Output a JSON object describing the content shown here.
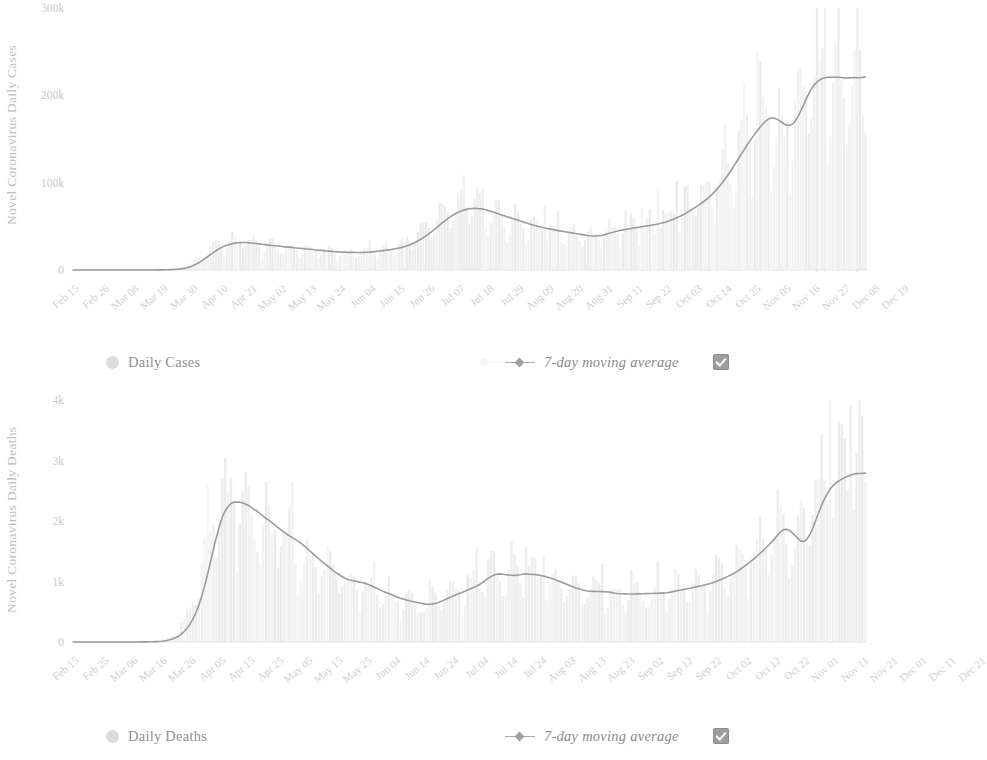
{
  "charts": [
    {
      "id": "cases",
      "ylabel": "Novel Coronavirus Daily Cases",
      "legend": {
        "bars_label": "Daily Cases",
        "avg_label": "7-day moving average",
        "checkbox_checked": true
      }
    },
    {
      "id": "deaths",
      "ylabel": "Novel Coronavirus Daily Deaths",
      "legend": {
        "bars_label": "Daily Deaths",
        "avg_label": "7-day moving average",
        "checkbox_checked": true
      }
    }
  ],
  "colors": {
    "bars": "#dcdcdc",
    "line": "#9b9b9b",
    "axis_text": "#c9c9c9",
    "legend_text": "#8f8f8f",
    "checkbox": "#9e9e9e"
  },
  "chart_data": [
    {
      "type": "bar",
      "id": "cases",
      "title": "",
      "xlabel": "",
      "ylabel": "Novel Coronavirus Daily Cases",
      "ylim": [
        0,
        300000
      ],
      "ytick_labels": [
        "0",
        "100k",
        "200k",
        "300k"
      ],
      "ytick_values": [
        0,
        100000,
        200000,
        300000
      ],
      "grid": false,
      "legend_position": "bottom",
      "xtick_labels": [
        "Feb 15",
        "Feb 26",
        "Mar 08",
        "Mar 19",
        "Mar 30",
        "Apr 10",
        "Apr 21",
        "May 02",
        "May 13",
        "May 24",
        "Jun 04",
        "Jun 15",
        "Jun 26",
        "Jul 07",
        "Jul 18",
        "Jul 29",
        "Aug 09",
        "Aug 20",
        "Aug 31",
        "Sep 11",
        "Sep 22",
        "Oct 03",
        "Oct 14",
        "Oct 25",
        "Nov 05",
        "Nov 16",
        "Nov 27",
        "Dec 08",
        "Dec 19"
      ],
      "xtick_indices": [
        0,
        11,
        22,
        33,
        44,
        55,
        66,
        77,
        88,
        99,
        110,
        121,
        132,
        143,
        154,
        165,
        176,
        187,
        198,
        209,
        220,
        231,
        242,
        253,
        264,
        275,
        286,
        297,
        308
      ],
      "series": [
        {
          "name": "Daily Cases",
          "kind": "bar",
          "values": [
            0,
            0,
            0,
            0,
            1,
            0,
            2,
            0,
            0,
            1,
            3,
            0,
            2,
            1,
            0,
            4,
            2,
            0,
            6,
            3,
            5,
            9,
            12,
            15,
            20,
            33,
            48,
            62,
            85,
            110,
            160,
            210,
            290,
            380,
            470,
            620,
            810,
            1100,
            1500,
            2000,
            2800,
            3900,
            5100,
            6600,
            8500,
            10500,
            12800,
            15500,
            18000,
            20500,
            22500,
            24500,
            26000,
            27500,
            28800,
            29600,
            30500,
            31000,
            31500,
            31800,
            32000,
            31600,
            31200,
            31500,
            30800,
            30200,
            29500,
            29800,
            29200,
            28500,
            28000,
            28500,
            27800,
            27200,
            26800,
            27200,
            26500,
            26000,
            25500,
            26000,
            25200,
            24800,
            24300,
            24800,
            24000,
            23500,
            23000,
            23500,
            22800,
            22300,
            21800,
            22300,
            21500,
            21000,
            20800,
            21300,
            20500,
            20200,
            20000,
            20500,
            20000,
            19800,
            20200,
            20500,
            20000,
            19600,
            20000,
            20400,
            20800,
            21000,
            21500,
            22000,
            21800,
            22500,
            23000,
            23500,
            24000,
            24500,
            25000,
            25500,
            26500,
            27500,
            28500,
            30000,
            31500,
            33000,
            35000,
            37000,
            39000,
            41000,
            43500,
            46000,
            48500,
            51000,
            54000,
            57000,
            59000,
            61500,
            63500,
            65000,
            66500,
            68000,
            69000,
            70000,
            70500,
            71000,
            71500,
            71000,
            70500,
            70000,
            69000,
            68500,
            67500,
            66000,
            65000,
            64000,
            63000,
            62000,
            61000,
            60000,
            59000,
            58000,
            57000,
            56000,
            55000,
            54000,
            53000,
            52000,
            51000,
            50000,
            49500,
            49000,
            48000,
            47500,
            47000,
            46000,
            45500,
            45000,
            44500,
            44000,
            43500,
            43000,
            42500,
            42000,
            41500,
            41000,
            40500,
            40000,
            39500,
            39000,
            38500,
            38000,
            38500,
            39000,
            40000,
            41000,
            42000,
            43000,
            44000,
            45000,
            45500,
            46000,
            46500,
            47000,
            47500,
            48000,
            48500,
            49000,
            49500,
            50000,
            50500,
            51000,
            51500,
            52000,
            52500,
            53000,
            54000,
            55000,
            56000,
            57000,
            58000,
            59500,
            61000,
            62500,
            64000,
            66000,
            68000,
            70000,
            72000,
            74000,
            76000,
            78000,
            80000,
            83000,
            86000,
            89000,
            92000,
            96000,
            100000,
            104000,
            108000,
            113000,
            118000,
            123000,
            128000,
            133000,
            138000,
            143000,
            148000,
            152000,
            156000,
            160000,
            164000,
            168000,
            172000,
            175000,
            177000,
            178000,
            176000,
            172000,
            168000,
            165000,
            163000,
            162000,
            163000,
            166000,
            172000,
            180000,
            190000,
            198000,
            205000,
            210000,
            214000,
            217000,
            219000,
            220000,
            221000,
            221500,
            222000,
            221000,
            220000,
            219000,
            220000,
            221000,
            222000,
            220000,
            218000,
            219000,
            220000,
            221000,
            222000,
            221000,
            220000,
            221000,
            222000
          ]
        },
        {
          "name": "7-day moving average",
          "kind": "line"
        }
      ]
    },
    {
      "type": "bar",
      "id": "deaths",
      "title": "",
      "xlabel": "",
      "ylabel": "Novel Coronavirus Daily Deaths",
      "ylim": [
        0,
        4000
      ],
      "ytick_labels": [
        "0",
        "1k",
        "2k",
        "3k",
        "4k"
      ],
      "ytick_values": [
        0,
        1000,
        2000,
        3000,
        4000
      ],
      "grid": false,
      "legend_position": "bottom",
      "xtick_labels": [
        "Feb 15",
        "Feb 25",
        "Mar 06",
        "Mar 16",
        "Mar 26",
        "Apr 05",
        "Apr 15",
        "Apr 25",
        "May 05",
        "May 15",
        "May 25",
        "Jun 04",
        "Jun 14",
        "Jun 24",
        "Jul 04",
        "Jul 14",
        "Jul 24",
        "Aug 03",
        "Aug 13",
        "Aug 23",
        "Sep 02",
        "Sep 12",
        "Sep 22",
        "Oct 02",
        "Oct 12",
        "Oct 22",
        "Nov 01",
        "Nov 11",
        "Nov 21",
        "Dec 01",
        "Dec 11",
        "Dec 21"
      ],
      "xtick_indices": [
        0,
        10,
        20,
        30,
        40,
        50,
        60,
        70,
        80,
        90,
        100,
        110,
        120,
        130,
        140,
        150,
        160,
        170,
        180,
        190,
        200,
        210,
        220,
        230,
        240,
        250,
        260,
        270,
        280,
        290,
        300,
        310
      ],
      "series": [
        {
          "name": "Daily Deaths",
          "kind": "bar",
          "values": [
            0,
            0,
            0,
            0,
            0,
            0,
            0,
            0,
            0,
            0,
            0,
            0,
            0,
            0,
            0,
            0,
            0,
            0,
            1,
            0,
            2,
            1,
            3,
            2,
            5,
            4,
            8,
            10,
            14,
            20,
            28,
            40,
            58,
            80,
            110,
            150,
            200,
            270,
            350,
            450,
            560,
            700,
            880,
            1080,
            1300,
            1550,
            1800,
            2000,
            2150,
            2250,
            2300,
            2350,
            2330,
            2300,
            2350,
            2300,
            2250,
            2300,
            2250,
            2200,
            2150,
            2100,
            2080,
            2050,
            2000,
            1980,
            1950,
            1900,
            1850,
            1800,
            1780,
            1750,
            1720,
            1700,
            1680,
            1650,
            1600,
            1550,
            1500,
            1450,
            1400,
            1380,
            1350,
            1300,
            1250,
            1200,
            1180,
            1150,
            1100,
            1080,
            1050,
            1020,
            1000,
            980,
            1000,
            1020,
            1000,
            980,
            950,
            930,
            900,
            880,
            860,
            840,
            820,
            800,
            780,
            760,
            740,
            720,
            700,
            690,
            680,
            670,
            660,
            650,
            640,
            630,
            620,
            610,
            600,
            620,
            650,
            680,
            700,
            720,
            740,
            760,
            780,
            800,
            820,
            840,
            860,
            880,
            900,
            920,
            940,
            960,
            1000,
            1050,
            1100,
            1150,
            1180,
            1150,
            1120,
            1100,
            1080,
            1060,
            1100,
            1150,
            1120,
            1100,
            1120,
            1140,
            1130,
            1120,
            1110,
            1100,
            1090,
            1080,
            1070,
            1050,
            1030,
            1010,
            990,
            970,
            950,
            930,
            910,
            890,
            870,
            860,
            850,
            840,
            830,
            820,
            830,
            840,
            850,
            840,
            830,
            820,
            810,
            800,
            790,
            780,
            790,
            800,
            810,
            800,
            790,
            780,
            790,
            800,
            810,
            820,
            810,
            800,
            790,
            800,
            810,
            820,
            830,
            840,
            850,
            860,
            870,
            880,
            890,
            900,
            910,
            920,
            930,
            940,
            950,
            960,
            980,
            1000,
            1020,
            1040,
            1060,
            1080,
            1100,
            1130,
            1160,
            1190,
            1220,
            1260,
            1300,
            1340,
            1380,
            1420,
            1460,
            1500,
            1550,
            1600,
            1650,
            1700,
            1760,
            1820,
            1880,
            1940,
            2000,
            1900,
            1750,
            1620,
            1560,
            1550,
            1600,
            1700,
            1850,
            2000,
            2150,
            2300,
            2420,
            2500,
            2560,
            2600,
            2640,
            2680,
            2700,
            2720,
            2740,
            2760,
            2780,
            2800,
            2820,
            2800,
            2780,
            2760,
            2780,
            2800
          ]
        },
        {
          "name": "7-day moving average",
          "kind": "line"
        }
      ]
    }
  ]
}
